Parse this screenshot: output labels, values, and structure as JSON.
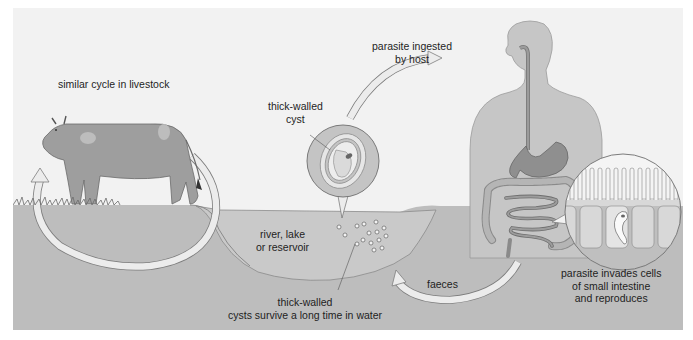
{
  "diagram": {
    "labels": {
      "livestock": "similar cycle in livestock",
      "cyst_line1": "thick-walled",
      "cyst_line2": "cyst",
      "ingested_line1": "parasite ingested",
      "ingested_line2": "by host",
      "water_line1": "river, lake",
      "water_line2": "or reservoir",
      "survive_line1": "thick-walled",
      "survive_line2": "cysts survive a long time in water",
      "faeces": "faeces",
      "invades_line1": "parasite invades cells",
      "invades_line2": "of small intestine",
      "invades_line3": "and reproduces"
    },
    "elements": [
      "cow-illustration",
      "cyst-magnified-inset",
      "human-torso-digestive-tract",
      "intestine-cells-inset",
      "water-body",
      "cysts-in-water"
    ],
    "cycle_arrows": [
      {
        "from": "cysts-in-water",
        "to": "cow",
        "label": ""
      },
      {
        "from": "cow",
        "to": "water-body",
        "label": ""
      },
      {
        "from": "cyst",
        "to": "human-mouth",
        "label": "parasite ingested by host"
      },
      {
        "from": "human-intestine",
        "to": "water-body",
        "label": "faeces"
      }
    ],
    "colors": {
      "panel": "#f2f2f2",
      "ground": "#b9b9b9",
      "water": "#c8c8c8",
      "body": "#c4c4c4",
      "organ": "#8e8e8e",
      "arrow": "#e2e2e2"
    }
  }
}
